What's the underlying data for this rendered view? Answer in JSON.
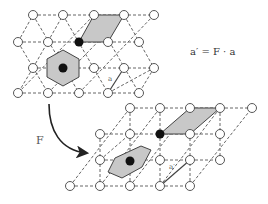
{
  "figure": {
    "formula": "a′ = F · a",
    "transform_label": "F",
    "vector_label_top": "a",
    "vector_label_bottom": "a′"
  },
  "colors": {
    "line": "#444444",
    "fill_gray": "#c8c8c8",
    "dot": "#111111"
  },
  "top_lattice": {
    "type": "triangular",
    "nodes": [
      [
        33,
        15
      ],
      [
        63,
        15
      ],
      [
        94,
        15
      ],
      [
        124,
        15
      ],
      [
        154,
        15
      ],
      [
        18,
        42
      ],
      [
        48,
        42
      ],
      [
        79,
        42
      ],
      [
        108,
        42
      ],
      [
        139,
        42
      ],
      [
        33,
        68
      ],
      [
        63,
        68
      ],
      [
        94,
        68
      ],
      [
        124,
        68
      ],
      [
        154,
        68
      ],
      [
        18,
        93
      ],
      [
        48,
        93
      ],
      [
        79,
        93
      ],
      [
        108,
        93
      ],
      [
        139,
        93
      ]
    ],
    "filled_node": [
      79,
      42
    ],
    "hexagon_center": [
      63,
      68
    ],
    "parallelogram": [
      [
        79,
        42
      ],
      [
        94,
        15
      ],
      [
        124,
        15
      ],
      [
        108,
        42
      ]
    ],
    "vector": {
      "from": [
        108,
        93
      ],
      "to": [
        124,
        68
      ]
    }
  },
  "bottom_lattice": {
    "type": "sheared-square",
    "filled_node": [
      160,
      134
    ],
    "hexagon_center": [
      130,
      160
    ],
    "parallelogram": [
      [
        160,
        134
      ],
      [
        190,
        108
      ],
      [
        220,
        108
      ],
      [
        190,
        134
      ]
    ],
    "vector": {
      "from": [
        160,
        186
      ],
      "to": [
        190,
        160
      ]
    }
  }
}
